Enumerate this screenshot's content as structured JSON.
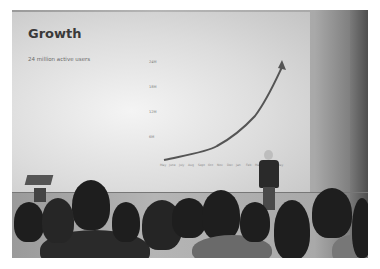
{
  "scene": {
    "description": "Grayscale photo of a speaker on stage in front of a projected slide showing a growth chart, with an audience in the foreground"
  },
  "slide": {
    "title": "Growth",
    "subtitle": "24 million active users",
    "y_ticks": [
      "24M",
      "18M",
      "12M",
      "6M"
    ],
    "x_ticks": [
      "May",
      "June",
      "July",
      "Aug",
      "Sept",
      "Oct",
      "Nov",
      "Dec",
      "Jan",
      "Feb",
      "Mar",
      "Apr",
      "May"
    ]
  }
}
